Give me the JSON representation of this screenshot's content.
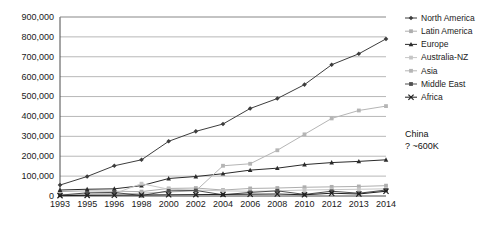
{
  "chart_data": {
    "type": "line",
    "title": "",
    "xlabel": "",
    "ylabel": "",
    "categories": [
      "1993",
      "1995",
      "1996",
      "1998",
      "2000",
      "2002",
      "2004",
      "2006",
      "2008",
      "2010",
      "2012",
      "2013",
      "2014"
    ],
    "ylim": [
      0,
      900000
    ],
    "ytick_labels": [
      "0",
      "100,000",
      "200,000",
      "300,000",
      "400,000",
      "500,000",
      "600,000",
      "700,000",
      "800,000",
      "900,000"
    ],
    "ytick_values": [
      0,
      100000,
      200000,
      300000,
      400000,
      500000,
      600000,
      700000,
      800000,
      900000
    ],
    "grid": true,
    "legend_position": "right",
    "series": [
      {
        "name": "North America",
        "color": "#3d3d3d",
        "marker": "diamond",
        "values": [
          55000,
          98000,
          152000,
          182000,
          275000,
          325000,
          362000,
          440000,
          490000,
          560000,
          660000,
          715000,
          790000
        ]
      },
      {
        "name": "Latin America",
        "color": "#aeaeae",
        "marker": "square",
        "values": [
          22000,
          26000,
          24000,
          22000,
          38000,
          40000,
          30000,
          38000,
          40000,
          44000,
          46000,
          48000,
          52000
        ]
      },
      {
        "name": "Europe",
        "color": "#2b2b2b",
        "marker": "triangle",
        "values": [
          30000,
          34000,
          36000,
          52000,
          88000,
          98000,
          112000,
          130000,
          140000,
          158000,
          168000,
          174000,
          182000
        ]
      },
      {
        "name": "Australia-NZ",
        "color": "#c6c6c6",
        "marker": "square",
        "values": [
          8000,
          10000,
          12000,
          62000,
          34000,
          30000,
          26000,
          24000,
          26000,
          30000,
          32000,
          34000,
          36000
        ]
      },
      {
        "name": "Asia",
        "color": "#b5b5b5",
        "marker": "square",
        "values": [
          6000,
          8000,
          10000,
          14000,
          20000,
          26000,
          152000,
          162000,
          230000,
          310000,
          390000,
          430000,
          452000
        ]
      },
      {
        "name": "Middle East",
        "color": "#4f4f4f",
        "marker": "square",
        "values": [
          4000,
          16000,
          18000,
          2000,
          26000,
          28000,
          6000,
          18000,
          26000,
          8000,
          24000,
          14000,
          30000
        ]
      },
      {
        "name": "Africa",
        "color": "#1f1f1f",
        "marker": "cross",
        "values": [
          2000,
          3000,
          4000,
          5000,
          6000,
          7000,
          8000,
          9000,
          10000,
          6000,
          14000,
          10000,
          24000
        ]
      }
    ],
    "annotation": {
      "line1": "China",
      "line2": "? ~600K"
    }
  },
  "legend": {
    "items": [
      {
        "label": "North America"
      },
      {
        "label": "Latin America"
      },
      {
        "label": "Europe"
      },
      {
        "label": "Australia-NZ"
      },
      {
        "label": "Asia"
      },
      {
        "label": "Middle East"
      },
      {
        "label": "Africa"
      }
    ]
  }
}
